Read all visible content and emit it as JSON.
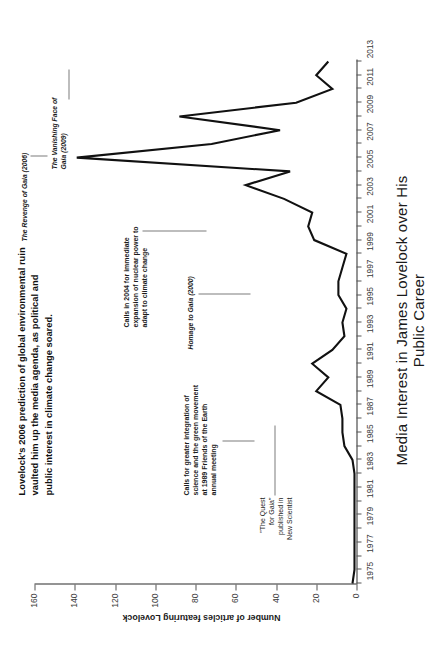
{
  "chart_data": {
    "type": "line",
    "title": "Media Interest in James Lovelock over His Public Career",
    "xlabel": "",
    "ylabel": "Number of articles featuring Lovelock",
    "xlim": [
      1975,
      2013
    ],
    "ylim": [
      0,
      160
    ],
    "grid": false,
    "legend": "none",
    "x_ticks": [
      "1975",
      "1977",
      "1979",
      "1981",
      "1983",
      "1985",
      "1987",
      "1989",
      "1991",
      "1993",
      "1995",
      "1997",
      "1999",
      "2001",
      "2003",
      "2005",
      "2007",
      "2009",
      "2011",
      "2013"
    ],
    "y_ticks": [
      "0",
      "20",
      "40",
      "60",
      "80",
      "100",
      "120",
      "140",
      "160"
    ],
    "x": [
      1975,
      1976,
      1977,
      1978,
      1979,
      1980,
      1981,
      1982,
      1983,
      1984,
      1985,
      1986,
      1987,
      1988,
      1989,
      1990,
      1991,
      1992,
      1993,
      1994,
      1995,
      1996,
      1997,
      1998,
      1999,
      2000,
      2001,
      2002,
      2003,
      2004,
      2005,
      2006,
      2007,
      2008,
      2009,
      2010,
      2011,
      2012,
      2013
    ],
    "values": [
      2,
      1,
      1,
      1,
      1,
      1,
      1,
      1,
      1,
      2,
      6,
      7,
      7,
      8,
      20,
      14,
      22,
      12,
      6,
      7,
      5,
      9,
      9,
      7,
      5,
      21,
      24,
      22,
      36,
      55,
      33,
      139,
      72,
      38,
      88,
      30,
      12,
      20,
      14
    ],
    "series": [
      {
        "name": "Number of articles featuring Lovelock",
        "values": [
          2,
          1,
          1,
          1,
          1,
          1,
          1,
          1,
          1,
          2,
          6,
          7,
          7,
          8,
          20,
          14,
          22,
          12,
          6,
          7,
          5,
          9,
          9,
          7,
          5,
          21,
          24,
          22,
          36,
          55,
          33,
          139,
          72,
          38,
          88,
          30,
          12,
          20,
          14
        ]
      }
    ],
    "annotations": [
      {
        "id": "quest-for-gaia",
        "text": "\"The Quest\nfor Gaia\"\npublished in\nNew Scientist",
        "style": "mixed",
        "year": 1975,
        "value": 2
      },
      {
        "id": "friends-of-the-earth-1989",
        "text": "Calls for greater integration of\nscience and the green movement\nat 1989 Friends of the Earth\nannual meeting",
        "style": "bold",
        "year": 1989,
        "value": 20
      },
      {
        "id": "homage-to-gaia-2000",
        "text": "Homage to Gaia (2000)",
        "style": "italic-bold",
        "year": 2000,
        "value": 21
      },
      {
        "id": "nuclear-power-2004",
        "text": "Calls in 2004 for immediate\nexpansion of nuclear power to\nadapt to climate change",
        "style": "bold",
        "year": 2004,
        "value": 55
      },
      {
        "id": "revenge-of-gaia-2006",
        "text": "The Revenge of Gaia (2006)",
        "style": "italic-bold",
        "year": 2006,
        "value": 139
      },
      {
        "id": "vanishing-face-of-gaia-2009",
        "text": "The Vanishing Face of\nGaia (2009)",
        "style": "italic-bold",
        "year": 2009,
        "value": 88
      }
    ],
    "caption": "Lovelock's 2006 prediction of global environmental ruin vaulted him up the media agenda, as political and public interest in climate change soared."
  },
  "axis": {
    "y_title": "Number of articles featuring Lovelock",
    "x_title": "Media Interest in James Lovelock over His Public Career",
    "y_ticks": [
      "160",
      "140",
      "120",
      "100",
      "80",
      "60",
      "40",
      "20",
      "0"
    ],
    "x_ticks": [
      "1975",
      "1977",
      "1979",
      "1981",
      "1983",
      "1985",
      "1987",
      "1989",
      "1991",
      "1993",
      "1995",
      "1997",
      "1999",
      "2001",
      "2003",
      "2005",
      "2007",
      "2009",
      "2011",
      "2013"
    ]
  },
  "annotations": {
    "caption": "Lovelock's 2006 prediction of global environmental ruin vaulted him up the media agenda, as political and public interest in climate change soared.",
    "quest_for_gaia": "\"The Quest\nfor Gaia\"\npublished in\nNew Scientist",
    "friends_of_earth": "Calls for greater integration of\nscience and the green movement\nat 1989 Friends of the Earth\nannual meeting",
    "homage_to_gaia": "Homage to Gaia (2000)",
    "nuclear_power": "Calls in 2004 for immediate\nexpansion of nuclear power to\nadapt to climate change",
    "revenge_of_gaia": "The Revenge of Gaia (2006)",
    "vanishing_face": "The Vanishing Face of\nGaia (2009)"
  },
  "colors": {
    "line": "#111111",
    "axis": "#2b2b2b",
    "tick_text": "#3a3a3a",
    "leader": "#7d7d7d",
    "background": "#ffffff"
  }
}
